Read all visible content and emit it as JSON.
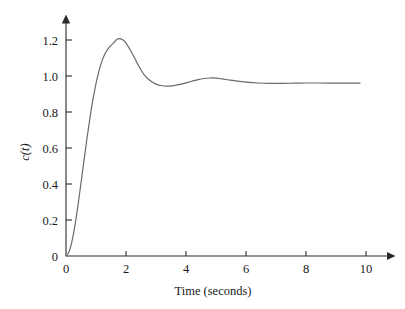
{
  "chart_data": {
    "type": "line",
    "title": "",
    "xlabel": "Time (seconds)",
    "ylabel": "c(t)",
    "xlim": [
      0,
      10
    ],
    "ylim": [
      0,
      1.3
    ],
    "grid": false,
    "legend": null,
    "xticks": [
      "0",
      "2",
      "4",
      "6",
      "8",
      "10"
    ],
    "xtick_values": [
      0,
      2,
      4,
      6,
      8,
      10
    ],
    "yticks": [
      "0",
      "0.2",
      "0.4",
      "0.6",
      "0.8",
      "1.0",
      "1.2"
    ],
    "ytick_values": [
      0,
      0.2,
      0.4,
      0.6,
      0.8,
      1.0,
      1.2
    ],
    "series": [
      {
        "name": "c(t)",
        "color": "#6a6a6a",
        "x": [
          0.0,
          0.1,
          0.2,
          0.3,
          0.4,
          0.5,
          0.6,
          0.7,
          0.8,
          0.9,
          1.0,
          1.1,
          1.2,
          1.3,
          1.4,
          1.5,
          1.6,
          1.7,
          1.8,
          1.9,
          2.0,
          2.2,
          2.4,
          2.6,
          2.8,
          3.0,
          3.2,
          3.4,
          3.6,
          3.8,
          4.0,
          4.2,
          4.4,
          4.6,
          4.8,
          5.0,
          5.2,
          5.4,
          5.6,
          5.8,
          6.0,
          6.4,
          6.8,
          7.2,
          7.6,
          8.0,
          8.5,
          9.0,
          9.5,
          9.8
        ],
        "y": [
          0.0,
          0.022,
          0.082,
          0.172,
          0.283,
          0.405,
          0.531,
          0.654,
          0.769,
          0.871,
          0.958,
          1.029,
          1.084,
          1.124,
          1.151,
          1.17,
          1.187,
          1.204,
          1.208,
          1.2,
          1.183,
          1.128,
          1.063,
          1.008,
          0.975,
          0.955,
          0.946,
          0.944,
          0.947,
          0.953,
          0.962,
          0.971,
          0.98,
          0.986,
          0.989,
          0.988,
          0.984,
          0.979,
          0.974,
          0.97,
          0.966,
          0.961,
          0.959,
          0.959,
          0.96,
          0.961,
          0.961,
          0.96,
          0.96,
          0.96
        ]
      }
    ],
    "annotations": {
      "peak_value": 1.21,
      "peak_time": 1.75,
      "trough_value": 0.945,
      "trough_time": 3.35,
      "second_peak_value": 0.99,
      "second_peak_time": 4.8,
      "steady_state": 0.96
    },
    "style": {
      "axis_color": "#2b2b2b",
      "curve_color": "#6a6a6a",
      "text_color": "#1a1a1a",
      "background": "#ffffff",
      "curve_width": 1.2,
      "axis_width": 1.1,
      "axis_arrows": true,
      "tick_direction": "inward"
    }
  }
}
